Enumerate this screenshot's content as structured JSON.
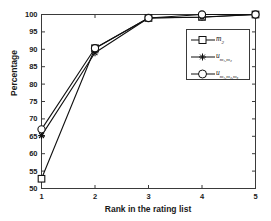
{
  "chart_data": {
    "type": "line",
    "title": "",
    "xlabel": "Rank in the rating list",
    "ylabel": "Percentage",
    "x": [
      1,
      2,
      3,
      4,
      5
    ],
    "xticklabels": [
      "1",
      "2",
      "3",
      "4",
      "5"
    ],
    "yticklabels": [
      "50",
      "55",
      "60",
      "65",
      "70",
      "75",
      "80",
      "85",
      "90",
      "95",
      "100"
    ],
    "xlim": [
      1,
      5
    ],
    "ylim": [
      50,
      100
    ],
    "ytick_step": 5,
    "grid": false,
    "legend_position": "center-right",
    "series": [
      {
        "name": "m_2",
        "label_base": "m",
        "label_sub": "2",
        "marker": "square",
        "color": "#111111",
        "values": [
          52.8,
          90.3,
          99.0,
          99.3,
          100.0
        ]
      },
      {
        "name": "u_m1,m2",
        "label_base": "u",
        "label_sub": "m₁,m₂",
        "marker": "star",
        "color": "#111111",
        "values": [
          65.2,
          89.0,
          99.0,
          99.2,
          100.0
        ]
      },
      {
        "name": "u_m1,m2,m3",
        "label_base": "u",
        "label_sub": "m₁,m₂,m₃",
        "marker": "circle",
        "color": "#111111",
        "values": [
          67.0,
          90.3,
          99.0,
          100.0,
          100.0
        ]
      }
    ]
  },
  "axes": {
    "frame_color": "#3a3a3a",
    "background": "#ffffff"
  }
}
